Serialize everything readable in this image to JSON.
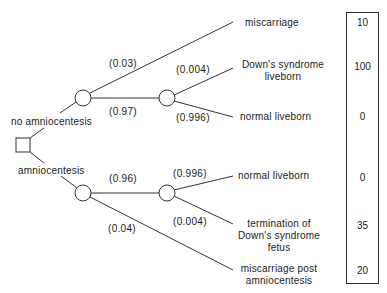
{
  "decision": {
    "options": [
      {
        "label": "no amniocentesis"
      },
      {
        "label": "amniocentesis"
      }
    ]
  },
  "branches": {
    "no_amnio": {
      "miscarriage_prob": "(0.03)",
      "continue_prob": "(0.97)",
      "downs_prob": "(0.004)",
      "normal_prob": "(0.996)"
    },
    "amnio": {
      "continue_prob": "(0.96)",
      "miscarriage_prob": "(0.04)",
      "normal_prob": "(0.996)",
      "downs_prob": "(0.004)"
    }
  },
  "outcomes": [
    {
      "label_lines": [
        "miscarriage"
      ],
      "utility": "10"
    },
    {
      "label_lines": [
        "Down's syndrome",
        "liveborn"
      ],
      "utility": "100"
    },
    {
      "label_lines": [
        "normal liveborn"
      ],
      "utility": "0"
    },
    {
      "label_lines": [
        "normal liveborn"
      ],
      "utility": "0"
    },
    {
      "label_lines": [
        "termination of",
        "Down's syndrome",
        "fetus"
      ],
      "utility": "35"
    },
    {
      "label_lines": [
        "miscarriage post",
        "amniocentesis"
      ],
      "utility": "20"
    }
  ],
  "colors": {
    "line": "#333333",
    "text": "#1a1a1a",
    "background": "#ffffff"
  }
}
